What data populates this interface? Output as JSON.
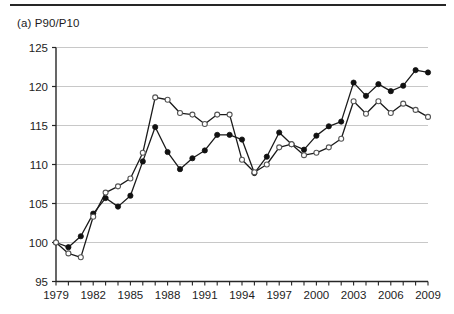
{
  "figure": {
    "panel_title": "(a) P90/P10",
    "colors": {
      "axis": "#262626",
      "grid": "#c8c8c8",
      "series_line": "#1a1a1a",
      "marker_fill_solid": "#111111",
      "marker_fill_open": "#ffffff",
      "background": "#ffffff"
    }
  },
  "chart_data": {
    "type": "line",
    "title": "(a) P90/P10",
    "xlabel": "",
    "ylabel": "",
    "xlim": [
      1979,
      2009
    ],
    "ylim": [
      95,
      125
    ],
    "ytick_step": 5,
    "yticks": [
      95,
      100,
      105,
      110,
      115,
      120,
      125
    ],
    "xticks": [
      1979,
      1980,
      1981,
      1982,
      1983,
      1984,
      1985,
      1986,
      1987,
      1988,
      1989,
      1990,
      1991,
      1992,
      1993,
      1994,
      1995,
      1996,
      1997,
      1998,
      1999,
      2000,
      2001,
      2002,
      2003,
      2004,
      2005,
      2006,
      2007,
      2008,
      2009
    ],
    "xtick_labels": [
      1979,
      1982,
      1985,
      1988,
      1991,
      1994,
      1997,
      2000,
      2003,
      2006,
      2009
    ],
    "grid": "horizontal",
    "legend": "none",
    "x": [
      1979,
      1980,
      1981,
      1982,
      1983,
      1984,
      1985,
      1986,
      1987,
      1988,
      1989,
      1990,
      1991,
      1992,
      1993,
      1994,
      1995,
      1996,
      1997,
      1998,
      1999,
      2000,
      2001,
      2002,
      2003,
      2004,
      2005,
      2006,
      2007,
      2008,
      2009
    ],
    "series": [
      {
        "name": "solid-marker-series",
        "marker": "filled-circle",
        "values": [
          100.0,
          99.4,
          100.8,
          103.7,
          105.7,
          104.6,
          106.0,
          110.4,
          114.8,
          111.6,
          109.4,
          110.8,
          111.8,
          113.8,
          113.8,
          113.2,
          108.9,
          111.0,
          114.1,
          112.6,
          111.9,
          113.7,
          114.9,
          115.5,
          120.5,
          118.8,
          120.3,
          119.4,
          120.1,
          122.1,
          121.8
        ]
      },
      {
        "name": "open-marker-series",
        "marker": "open-circle",
        "values": [
          100.0,
          98.6,
          98.1,
          103.3,
          106.4,
          107.2,
          108.2,
          111.5,
          118.6,
          118.3,
          116.6,
          116.4,
          115.2,
          116.4,
          116.4,
          110.6,
          109.0,
          110.0,
          112.2,
          112.6,
          111.2,
          111.5,
          112.2,
          113.3,
          118.1,
          116.5,
          118.1,
          116.6,
          117.8,
          117.0,
          116.1
        ]
      }
    ]
  }
}
